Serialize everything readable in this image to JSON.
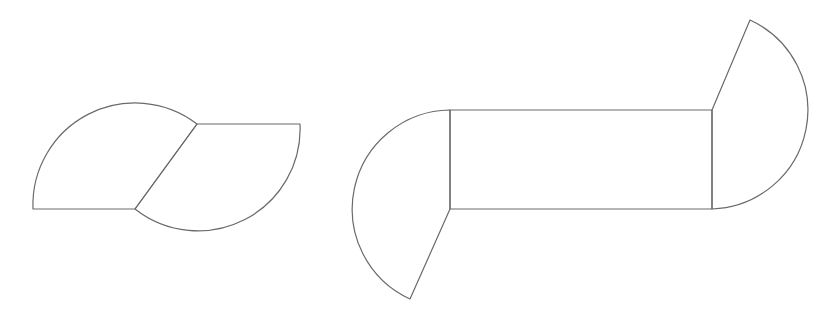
{
  "canvas": {
    "width": 839,
    "height": 315,
    "background": "#ffffff",
    "stroke_color": "#6a6a6a"
  },
  "figures": [
    {
      "name": "two-sector-shape",
      "description": "Two circular sectors joined along a slanted shared edge (parallelogram-like leaf shape)",
      "points": {
        "bottom_left": [
          33,
          209
        ],
        "bottom_mid": [
          135,
          209
        ],
        "top_mid": [
          197,
          124
        ],
        "top_right": [
          300,
          124
        ]
      }
    },
    {
      "name": "rectangle-with-two-sectors",
      "description": "Rectangle with a circular sector attached to its left edge (opening downward) and one attached to its right edge (opening upward)",
      "points": {
        "rect_top_left": [
          450,
          110
        ],
        "rect_bottom_left": [
          450,
          209
        ],
        "rect_top_right": [
          712,
          110
        ],
        "rect_bottom_right": [
          712,
          209
        ],
        "left_sector_tip": [
          410,
          299
        ],
        "right_sector_tip": [
          750,
          20
        ]
      }
    }
  ]
}
